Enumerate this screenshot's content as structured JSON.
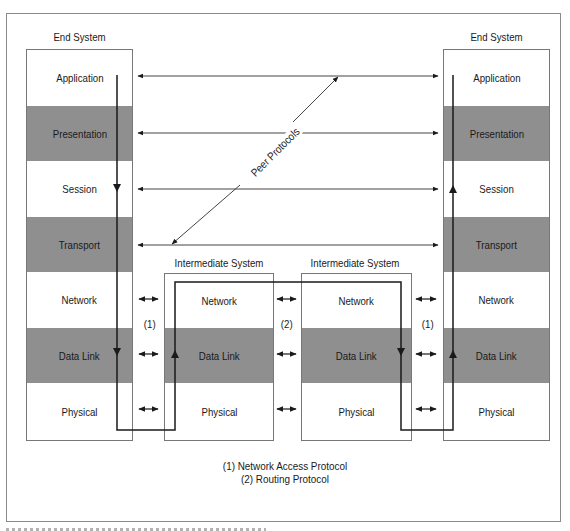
{
  "diagram": {
    "left_end_system": {
      "title": "End System",
      "layers": [
        {
          "label": "Application",
          "shaded": false
        },
        {
          "label": "Presentation",
          "shaded": true
        },
        {
          "label": "Session",
          "shaded": false
        },
        {
          "label": "Transport",
          "shaded": true
        },
        {
          "label": "Network",
          "shaded": false
        },
        {
          "label": "Data Link",
          "shaded": true
        },
        {
          "label": "Physical",
          "shaded": false
        }
      ]
    },
    "right_end_system": {
      "title": "End System",
      "layers": [
        {
          "label": "Application",
          "shaded": false
        },
        {
          "label": "Presentation",
          "shaded": true
        },
        {
          "label": "Session",
          "shaded": false
        },
        {
          "label": "Transport",
          "shaded": true
        },
        {
          "label": "Network",
          "shaded": false
        },
        {
          "label": "Data Link",
          "shaded": true
        },
        {
          "label": "Physical",
          "shaded": false
        }
      ]
    },
    "intermediate_system_1": {
      "title": "Intermediate System",
      "layers": [
        {
          "label": "Network",
          "shaded": false
        },
        {
          "label": "Data Link",
          "shaded": true
        },
        {
          "label": "Physical",
          "shaded": false
        }
      ]
    },
    "intermediate_system_2": {
      "title": "Intermediate System",
      "layers": [
        {
          "label": "Network",
          "shaded": false
        },
        {
          "label": "Data Link",
          "shaded": true
        },
        {
          "label": "Physical",
          "shaded": false
        }
      ]
    },
    "peer_protocols_label": "Peer Protocols",
    "link_markers": {
      "left": "(1)",
      "middle": "(2)",
      "right": "(1)"
    },
    "legend": [
      "(1) Network Access Protocol",
      "(2) Routing Protocol"
    ],
    "colors": {
      "shaded_layer": "#8f8f8f",
      "line": "#1a1a1a",
      "border": "#777777"
    }
  }
}
